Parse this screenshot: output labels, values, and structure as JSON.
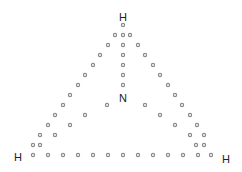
{
  "diagram": {
    "atoms": [
      {
        "id": "h-top",
        "label": "H",
        "x": 123,
        "y": 21
      },
      {
        "id": "n-center",
        "label": "N",
        "x": 123,
        "y": 102
      },
      {
        "id": "h-left",
        "label": "H",
        "x": 18,
        "y": 161
      },
      {
        "id": "h-right",
        "label": "H",
        "x": 226,
        "y": 163
      }
    ],
    "dots": [
      [
        123,
        25
      ],
      [
        123,
        35
      ],
      [
        123,
        45
      ],
      [
        123,
        55
      ],
      [
        123,
        65
      ],
      [
        123,
        75
      ],
      [
        123,
        85
      ],
      [
        115,
        35
      ],
      [
        130,
        35
      ],
      [
        108,
        45
      ],
      [
        100,
        55
      ],
      [
        93,
        65
      ],
      [
        85,
        75
      ],
      [
        78,
        85
      ],
      [
        70,
        95
      ],
      [
        63,
        105
      ],
      [
        55,
        115
      ],
      [
        48,
        125
      ],
      [
        40,
        135
      ],
      [
        33,
        145
      ],
      [
        107,
        105
      ],
      [
        85,
        115
      ],
      [
        70,
        125
      ],
      [
        55,
        135
      ],
      [
        40,
        145
      ],
      [
        33,
        155
      ],
      [
        48,
        155
      ],
      [
        63,
        155
      ],
      [
        78,
        155
      ],
      [
        93,
        155
      ],
      [
        108,
        155
      ],
      [
        123,
        155
      ],
      [
        138,
        155
      ],
      [
        153,
        155
      ],
      [
        168,
        155
      ],
      [
        183,
        155
      ],
      [
        198,
        155
      ],
      [
        211,
        155
      ],
      [
        138,
        45
      ],
      [
        145,
        55
      ],
      [
        153,
        65
      ],
      [
        160,
        75
      ],
      [
        168,
        85
      ],
      [
        175,
        95
      ],
      [
        182,
        105
      ],
      [
        190,
        115
      ],
      [
        197,
        125
      ],
      [
        204,
        135
      ],
      [
        204,
        145
      ],
      [
        145,
        105
      ],
      [
        160,
        115
      ],
      [
        175,
        125
      ],
      [
        190,
        135
      ],
      [
        196,
        145
      ]
    ],
    "colors": {
      "dot_stroke": "#8a8a8a",
      "text": "#222222",
      "background": "#ffffff"
    }
  }
}
